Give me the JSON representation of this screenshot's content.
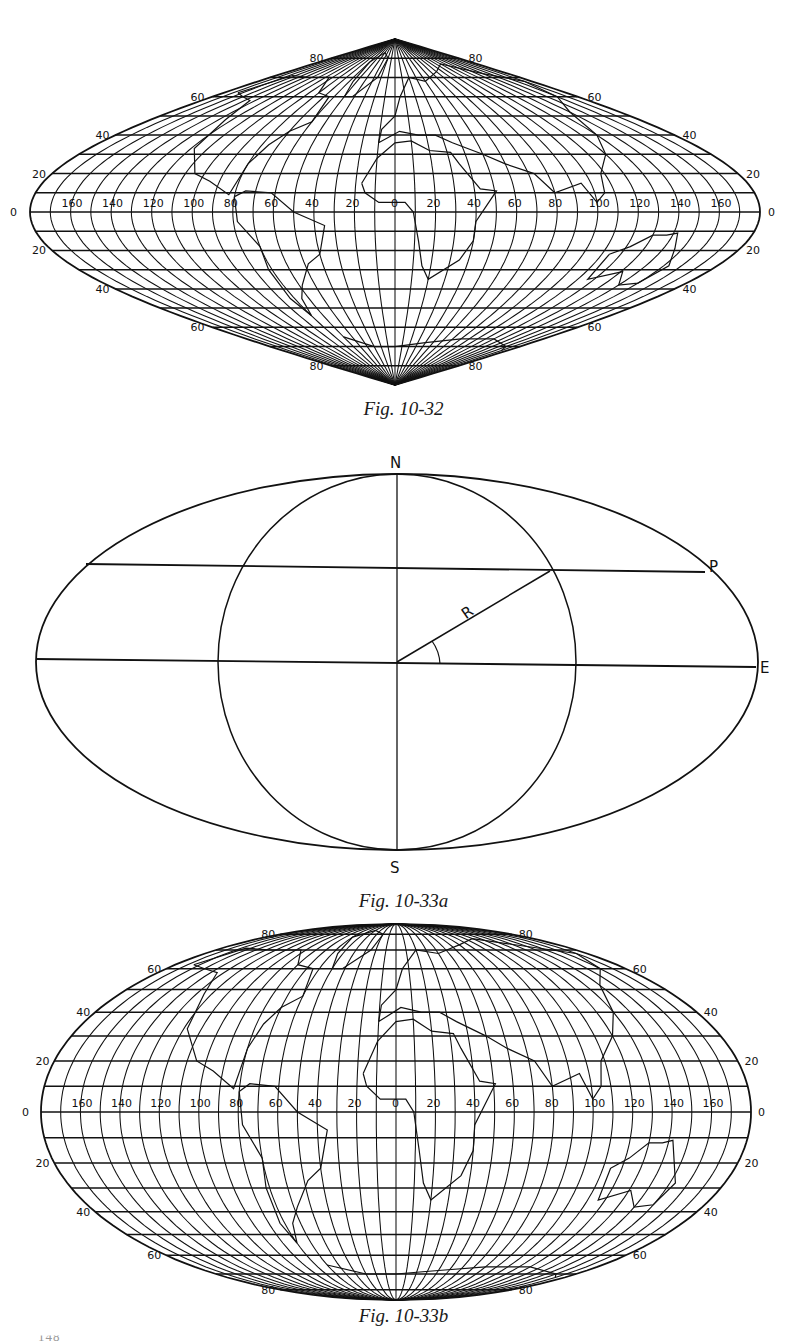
{
  "page": {
    "page_number": "148",
    "ink_color": "#111111",
    "background": "#ffffff"
  },
  "figures": [
    {
      "id": "fig-10-32",
      "caption": "Fig. 10-32",
      "projection": "sinusoidal",
      "description": "World map on sinusoidal (Sanson-Flamsteed) projection with 10° graticule",
      "latitude_labels": [
        "80",
        "60",
        "40",
        "20",
        "0",
        "20",
        "40",
        "60",
        "80"
      ],
      "longitude_labels": [
        "160",
        "140",
        "120",
        "100",
        "80",
        "60",
        "40",
        "20",
        "0",
        "20",
        "40",
        "60",
        "80",
        "100",
        "120",
        "140",
        "160"
      ],
      "graticule_step_deg": 10
    },
    {
      "id": "fig-10-33a",
      "caption": "Fig. 10-33a",
      "projection": "mollweide-construction",
      "description": "Construction diagram for Mollweide projection: ellipse with inscribed circle, radius R at angle, parallel through P",
      "point_labels": {
        "north": "N",
        "south": "S",
        "east": "E",
        "parallel_point": "P",
        "radius": "R"
      }
    },
    {
      "id": "fig-10-33b",
      "caption": "Fig. 10-33b",
      "projection": "mollweide",
      "description": "World map on Mollweide (homolographic) projection with 10° graticule",
      "latitude_labels": [
        "80",
        "60",
        "40",
        "20",
        "0",
        "20",
        "40",
        "60",
        "80"
      ],
      "longitude_labels": [
        "160",
        "140",
        "120",
        "100",
        "80",
        "60",
        "40",
        "20",
        "0",
        "20",
        "40",
        "60",
        "80",
        "100",
        "120",
        "140",
        "160"
      ],
      "graticule_step_deg": 10
    }
  ]
}
